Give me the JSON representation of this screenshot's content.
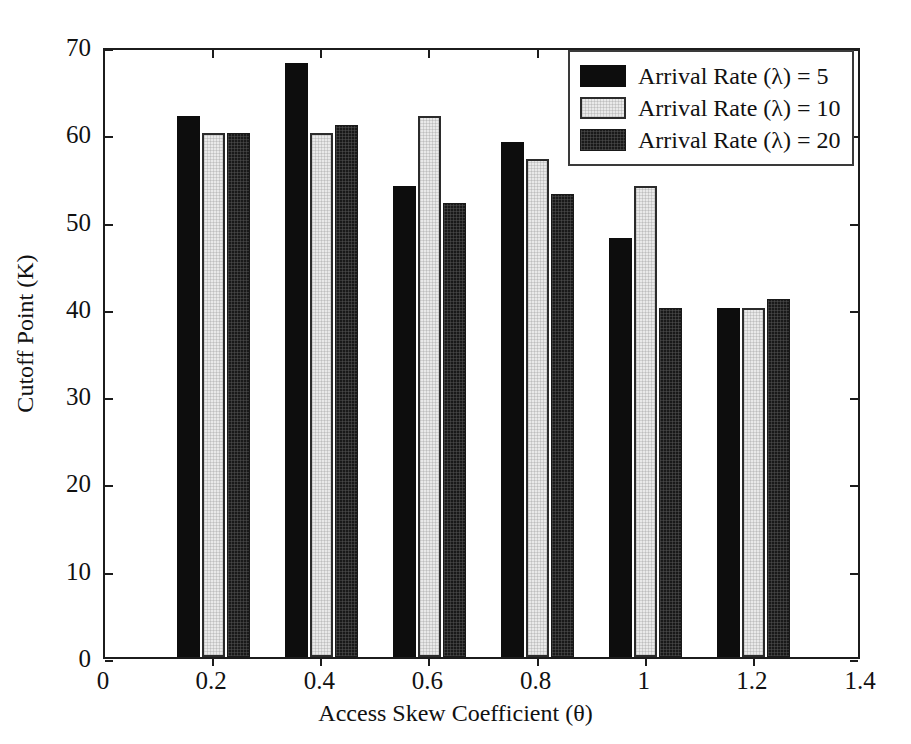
{
  "chart_data": {
    "type": "bar",
    "title": "",
    "xlabel": "Access Skew Coefficient (θ)",
    "ylabel": "Cutoff Point (K)",
    "categories": [
      "0.2",
      "0.4",
      "0.6",
      "0.8",
      "1",
      "1.2"
    ],
    "x": [
      0.2,
      0.4,
      0.6,
      0.8,
      1.0,
      1.2
    ],
    "xlim": [
      0,
      1.4
    ],
    "ylim": [
      0,
      70
    ],
    "xticks": [
      "0",
      "0.2",
      "0.4",
      "0.6",
      "0.8",
      "1",
      "1.2",
      "1.4"
    ],
    "yticks": [
      "0",
      "10",
      "20",
      "30",
      "40",
      "50",
      "60",
      "70"
    ],
    "grid": false,
    "legend_position": "top-right",
    "series": [
      {
        "name": "Arrival Rate (λ) = 5",
        "values": [
          62,
          68,
          54,
          59,
          48,
          40
        ],
        "color": "#0d0d0d"
      },
      {
        "name": "Arrival Rate (λ) = 10",
        "values": [
          60,
          60,
          62,
          57,
          54,
          40
        ],
        "color": "#e9e9e9"
      },
      {
        "name": "Arrival Rate (λ) = 20",
        "values": [
          60,
          61,
          52,
          53,
          40,
          41
        ],
        "color": "#191919"
      }
    ]
  },
  "legend": {
    "entries": [
      "Arrival Rate (λ) = 5",
      "Arrival Rate (λ) = 10",
      "Arrival Rate (λ) = 20"
    ]
  }
}
